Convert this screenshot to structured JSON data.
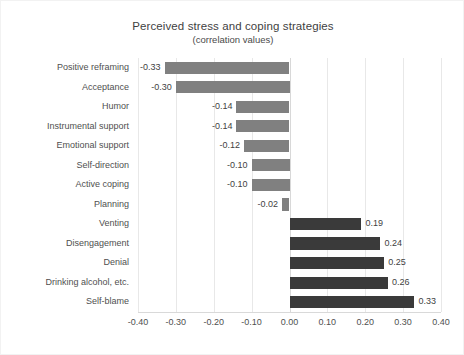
{
  "chart_data": {
    "type": "bar",
    "orientation": "horizontal",
    "title": "Perceived stress and coping strategies",
    "subtitle": "(correlation values)",
    "xlabel": "",
    "ylabel": "",
    "xlim": [
      -0.4,
      0.4
    ],
    "xticks": [
      "-0.40",
      "-0.30",
      "-0.20",
      "-0.10",
      "0.00",
      "0.10",
      "0.20",
      "0.30",
      "0.40"
    ],
    "xtick_values": [
      -0.4,
      -0.3,
      -0.2,
      -0.1,
      0.0,
      0.1,
      0.2,
      0.3,
      0.4
    ],
    "grid": true,
    "legend": false,
    "categories": [
      "Positive reframing",
      "Acceptance",
      "Humor",
      "Instrumental support",
      "Emotional support",
      "Self-direction",
      "Active coping",
      "Planning",
      "Venting",
      "Disengagement",
      "Denial",
      "Drinking alcohol, etc.",
      "Self-blame"
    ],
    "values": [
      -0.33,
      -0.3,
      -0.14,
      -0.14,
      -0.12,
      -0.1,
      -0.1,
      -0.02,
      0.19,
      0.24,
      0.25,
      0.26,
      0.33
    ],
    "labels": [
      "-0.33",
      "-0.30",
      "-0.14",
      "-0.14",
      "-0.12",
      "-0.10",
      "-0.10",
      "-0.02",
      "0.19",
      "0.24",
      "0.25",
      "0.26",
      "0.33"
    ],
    "colors": {
      "negative_bar": "#808080",
      "positive_bar": "#3a3a3a",
      "gridline": "#e8e8e8",
      "zero_line": "#d8d8d8",
      "text": "#4f4f4f",
      "background": "#ffffff"
    }
  }
}
